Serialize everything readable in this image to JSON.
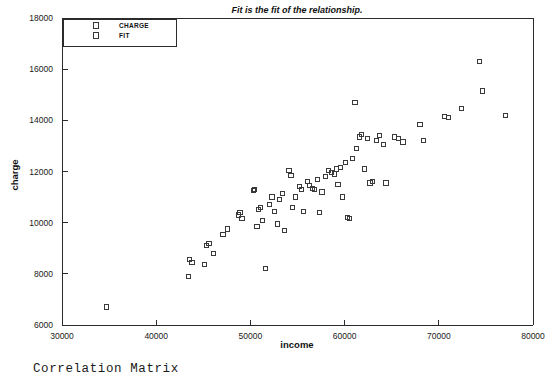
{
  "chart_data": {
    "type": "scatter",
    "title": "Fit is the fit of the relationship.",
    "xlabel": "income",
    "ylabel": "charge",
    "xlim": [
      30000,
      80000
    ],
    "ylim": [
      6000,
      18000
    ],
    "xticks": [
      30000,
      40000,
      50000,
      60000,
      70000,
      80000
    ],
    "xtick_labels": [
      "30000",
      "40000",
      "50000",
      "60000",
      "70000",
      "80000"
    ],
    "yticks": [
      6000,
      8000,
      10000,
      12000,
      14000,
      16000,
      18000
    ],
    "ytick_labels": [
      "6000",
      "8000",
      "10000",
      "12000",
      "14000",
      "16000",
      "18000"
    ],
    "grid": false,
    "legend_position": "top-left",
    "legend": [
      {
        "name": "CHARGE",
        "marker": "open-square"
      },
      {
        "name": "FIT",
        "marker": "open-square"
      }
    ],
    "series": [
      {
        "name": "CHARGE",
        "marker": "open-square",
        "points": [
          [
            34700,
            6700
          ],
          [
            43400,
            7900
          ],
          [
            43500,
            8550
          ],
          [
            43800,
            8450
          ],
          [
            45100,
            8350
          ],
          [
            45300,
            9100
          ],
          [
            45600,
            9200
          ],
          [
            46100,
            8800
          ],
          [
            47100,
            9550
          ],
          [
            47600,
            9750
          ],
          [
            48700,
            10300
          ],
          [
            48900,
            10400
          ],
          [
            49100,
            10150
          ],
          [
            50300,
            11250
          ],
          [
            50400,
            11300
          ],
          [
            50700,
            9850
          ],
          [
            50900,
            10500
          ],
          [
            51100,
            10600
          ],
          [
            51300,
            10100
          ],
          [
            51600,
            8200
          ],
          [
            52000,
            10700
          ],
          [
            52300,
            11000
          ],
          [
            52600,
            10450
          ],
          [
            52900,
            9950
          ],
          [
            53100,
            10900
          ],
          [
            53400,
            11150
          ],
          [
            53600,
            9700
          ],
          [
            54100,
            12050
          ],
          [
            54300,
            11850
          ],
          [
            54500,
            10600
          ],
          [
            54800,
            11000
          ],
          [
            55200,
            11400
          ],
          [
            55400,
            11300
          ],
          [
            55600,
            10450
          ],
          [
            56100,
            11600
          ],
          [
            56300,
            11450
          ],
          [
            56600,
            11350
          ],
          [
            56800,
            11300
          ],
          [
            57100,
            11700
          ],
          [
            57300,
            10400
          ],
          [
            57600,
            11200
          ],
          [
            58000,
            11800
          ],
          [
            58300,
            12050
          ],
          [
            58600,
            11950
          ],
          [
            58900,
            11900
          ],
          [
            59100,
            12100
          ],
          [
            59300,
            11500
          ],
          [
            59600,
            12150
          ],
          [
            59800,
            11000
          ],
          [
            60100,
            12350
          ],
          [
            60300,
            10200
          ],
          [
            60500,
            10150
          ],
          [
            60800,
            12500
          ],
          [
            61100,
            14700
          ],
          [
            61300,
            12900
          ],
          [
            61600,
            13350
          ],
          [
            61800,
            13450
          ],
          [
            62100,
            12100
          ],
          [
            62400,
            13300
          ],
          [
            62700,
            11550
          ],
          [
            63000,
            11600
          ],
          [
            63400,
            13200
          ],
          [
            63700,
            13400
          ],
          [
            64100,
            13050
          ],
          [
            64400,
            11550
          ],
          [
            65300,
            13350
          ],
          [
            65700,
            13300
          ],
          [
            66200,
            13150
          ],
          [
            68000,
            13850
          ],
          [
            68400,
            13200
          ],
          [
            70600,
            14150
          ],
          [
            71000,
            14100
          ],
          [
            72400,
            14450
          ],
          [
            74300,
            16300
          ],
          [
            74600,
            15150
          ],
          [
            77100,
            14200
          ]
        ]
      }
    ]
  },
  "footer": {
    "text": "Correlation Matrix"
  }
}
